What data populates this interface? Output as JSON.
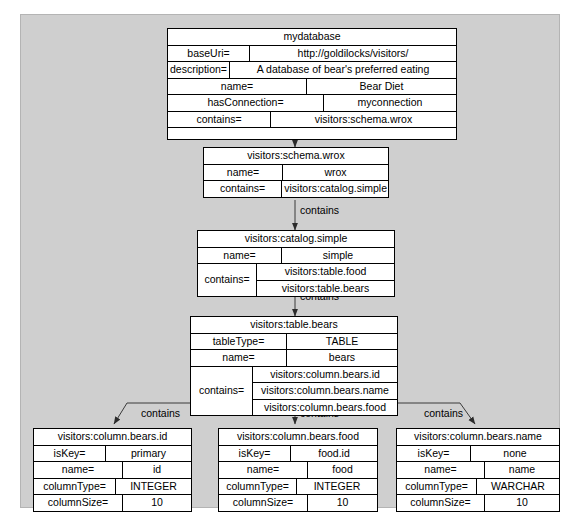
{
  "diagram": {
    "type": "rdf-graph-diagram",
    "background_color": "#cfcfcf",
    "node_fill": "#ffffff",
    "edge_color": "#3a3a3a",
    "edge_labels": {
      "contains": "contains"
    },
    "nodes": [
      {
        "id": "mydatabase",
        "title": "mydatabase",
        "rows": [
          {
            "key": "baseUri=",
            "value": "http://goldilocks/visitors/"
          },
          {
            "key": "description=",
            "value": "A database of bear's preferred eating"
          },
          {
            "key": "name=",
            "value": "Bear Diet"
          },
          {
            "key": "hasConnection=",
            "value": "myconnection"
          },
          {
            "key": "contains=",
            "value": "visitors:schema.wrox"
          },
          {
            "key": "",
            "value": ""
          }
        ]
      },
      {
        "id": "schema-wrox",
        "title": "visitors:schema.wrox",
        "rows": [
          {
            "key": "name=",
            "value": "wrox"
          },
          {
            "key": "contains=",
            "value": "visitors:catalog.simple"
          }
        ]
      },
      {
        "id": "catalog-simple",
        "title": "visitors:catalog.simple",
        "rows": [
          {
            "key": "name=",
            "value": "simple"
          },
          {
            "key": "contains=",
            "values": [
              "visitors:table.food",
              "visitors:table.bears"
            ]
          }
        ]
      },
      {
        "id": "table-bears",
        "title": "visitors:table.bears",
        "rows": [
          {
            "key": "tableType=",
            "value": "TABLE"
          },
          {
            "key": "name=",
            "value": "bears"
          },
          {
            "key": "contains=",
            "values": [
              "visitors:column.bears.id",
              "visitors:column.bears.name",
              "visitors:column.bears.food"
            ]
          }
        ]
      },
      {
        "id": "column-bears-id",
        "title": "visitors:column.bears.id",
        "rows": [
          {
            "key": "isKey=",
            "value": "primary"
          },
          {
            "key": "name=",
            "value": "id"
          },
          {
            "key": "columnType=",
            "value": "INTEGER"
          },
          {
            "key": "columnSize=",
            "value": "10"
          }
        ]
      },
      {
        "id": "column-bears-food",
        "title": "visitors:column.bears.food",
        "rows": [
          {
            "key": "isKey=",
            "value": "food.id"
          },
          {
            "key": "name=",
            "value": "food"
          },
          {
            "key": "columnType=",
            "value": "INTEGER"
          },
          {
            "key": "columnSize=",
            "value": "10"
          }
        ]
      },
      {
        "id": "column-bears-name",
        "title": "visitors:column.bears.name",
        "rows": [
          {
            "key": "isKey=",
            "value": "none"
          },
          {
            "key": "name=",
            "value": "name"
          },
          {
            "key": "columnType=",
            "value": "WARCHAR"
          },
          {
            "key": "columnSize=",
            "value": "10"
          }
        ]
      }
    ],
    "edges": [
      {
        "from": "mydatabase",
        "to": "schema-wrox",
        "label": "contains"
      },
      {
        "from": "schema-wrox",
        "to": "catalog-simple",
        "label": "contains"
      },
      {
        "from": "catalog-simple",
        "to": "table-bears",
        "label": "contains"
      },
      {
        "from": "table-bears",
        "to": "column-bears-id",
        "label": "contains"
      },
      {
        "from": "table-bears",
        "to": "column-bears-food",
        "label": "contains"
      },
      {
        "from": "table-bears",
        "to": "column-bears-name",
        "label": "contains"
      }
    ]
  }
}
